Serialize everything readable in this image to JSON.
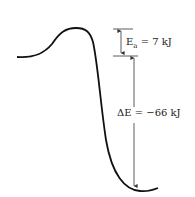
{
  "diagram": {
    "type": "energy-profile",
    "activation_energy": {
      "symbol": "E",
      "subscript": "a",
      "text": " = 7 kJ"
    },
    "delta_e": {
      "text": "ΔE = −66 kJ"
    },
    "colors": {
      "curve": "#111111",
      "arrows": "#333333"
    }
  }
}
